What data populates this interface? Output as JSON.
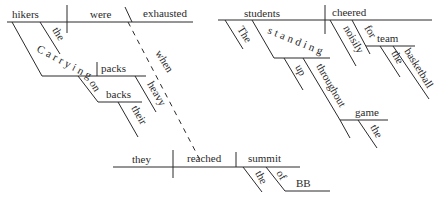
{
  "diagram": {
    "type": "sentence-diagram",
    "colors": {
      "ink": "#2a2a2a",
      "background": "#ffffff"
    },
    "clause_1": {
      "subject": "hikers",
      "subject_modifier": "the",
      "verb": "were",
      "complement": "exhausted",
      "participial_phrase": {
        "participle": "Carrying",
        "object": "packs",
        "object_modifier": "heavy",
        "prepositional_phrase": {
          "preposition": "on",
          "object": "backs",
          "modifier": "their"
        }
      },
      "connector": "when"
    },
    "clause_2": {
      "subject": "they",
      "verb": "reached",
      "object": "summit",
      "object_modifier": "the",
      "prepositional_phrase": {
        "preposition": "of",
        "object": "BB"
      }
    },
    "clause_3": {
      "subject": "students",
      "subject_modifier": "The",
      "verb": "cheered",
      "adverb": "noisily",
      "participial_phrase": {
        "participle": "standing",
        "adverb": "up",
        "prepositional_phrase": {
          "preposition": "throughout",
          "object": "game",
          "modifier": "the"
        }
      },
      "prepositional_phrase": {
        "preposition": "for",
        "object": "team",
        "modifiers": [
          "the",
          "basketball"
        ]
      }
    }
  }
}
